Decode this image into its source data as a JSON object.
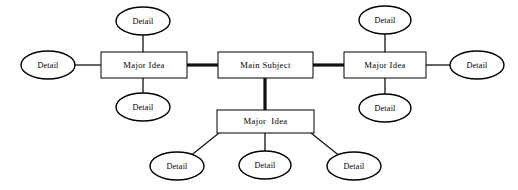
{
  "diagram": {
    "type": "concept-map",
    "background_color": "#ffffff",
    "stroke_color": "#000000",
    "nodes": {
      "main_subject": {
        "label": "Main Subject",
        "shape": "rectangle"
      },
      "major_idea_left": {
        "label": "Major Idea",
        "shape": "rectangle"
      },
      "major_idea_right": {
        "label": "Major Idea",
        "shape": "rectangle"
      },
      "major_idea_bottom": {
        "label": "Major  Idea",
        "shape": "rectangle"
      },
      "details": [
        {
          "id": "detail-left-top",
          "label": "Detail",
          "shape": "ellipse"
        },
        {
          "id": "detail-left-side",
          "label": "Detail",
          "shape": "ellipse"
        },
        {
          "id": "detail-left-bottom",
          "label": "Detail",
          "shape": "ellipse"
        },
        {
          "id": "detail-right-top",
          "label": "Detail",
          "shape": "ellipse"
        },
        {
          "id": "detail-right-side",
          "label": "Detail",
          "shape": "ellipse"
        },
        {
          "id": "detail-right-bottom",
          "label": "Detail",
          "shape": "ellipse"
        },
        {
          "id": "detail-bottom-left",
          "label": "Detail",
          "shape": "ellipse"
        },
        {
          "id": "detail-bottom-center",
          "label": "Detail",
          "shape": "ellipse"
        },
        {
          "id": "detail-bottom-right",
          "label": "Detail",
          "shape": "ellipse"
        }
      ]
    }
  }
}
